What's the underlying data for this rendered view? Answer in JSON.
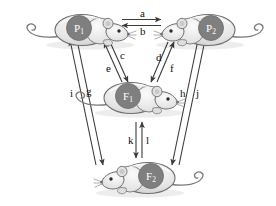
{
  "figure": {
    "background_color": "#ffffff",
    "line_color": "#3b3b3b",
    "badge_fill": "#7f7f7f",
    "badge_text_color": "#ffffff",
    "mouse_body_color": "#e9e9e9",
    "mouse_outline_color": "#6e6e6e"
  },
  "organisms": [
    {
      "id": "P1",
      "label": "P",
      "subscript": "1",
      "name": "parent-one-mouse",
      "facing": "right",
      "x": 88,
      "y": 30
    },
    {
      "id": "P2",
      "label": "P",
      "subscript": "2",
      "name": "parent-two-mouse",
      "facing": "left",
      "x": 202,
      "y": 30
    },
    {
      "id": "F1",
      "label": "F",
      "subscript": "1",
      "name": "f1-generation-mouse",
      "facing": "right",
      "x": 137,
      "y": 98
    },
    {
      "id": "F2",
      "label": "F",
      "subscript": "2",
      "name": "f2-generation-mouse",
      "facing": "left",
      "x": 142,
      "y": 178
    }
  ],
  "arrows": [
    {
      "id": "a",
      "label": "a",
      "from": "P1",
      "to": "P2",
      "label_x": 140,
      "label_y": 8,
      "direction": "right"
    },
    {
      "id": "b",
      "label": "b",
      "from": "P2",
      "to": "P1",
      "label_x": 140,
      "label_y": 26,
      "direction": "left"
    },
    {
      "id": "c",
      "label": "c",
      "from": "P1",
      "to": "F1",
      "label_x": 120,
      "label_y": 50,
      "direction": "down-right"
    },
    {
      "id": "e",
      "label": "e",
      "from": "F1",
      "to": "P1",
      "label_x": 106,
      "label_y": 63,
      "direction": "up-left"
    },
    {
      "id": "d",
      "label": "d",
      "from": "F1",
      "to": "P2",
      "label_x": 156,
      "label_y": 52,
      "direction": "up-right"
    },
    {
      "id": "f",
      "label": "f",
      "from": "P2",
      "to": "F1",
      "label_x": 170,
      "label_y": 63,
      "direction": "down-left"
    },
    {
      "id": "i",
      "label": "i",
      "from": "F2",
      "to": "P1",
      "label_x": 70,
      "label_y": 88,
      "direction": "up"
    },
    {
      "id": "g",
      "label": "g",
      "from": "P1",
      "to": "F2",
      "label_x": 86,
      "label_y": 86,
      "direction": "down"
    },
    {
      "id": "h",
      "label": "h",
      "from": "P2",
      "to": "F2",
      "label_x": 180,
      "label_y": 88,
      "direction": "down"
    },
    {
      "id": "j",
      "label": "j",
      "from": "F2",
      "to": "P2",
      "label_x": 196,
      "label_y": 88,
      "direction": "up"
    },
    {
      "id": "k",
      "label": "k",
      "from": "F1",
      "to": "F2",
      "label_x": 128,
      "label_y": 135,
      "direction": "down"
    },
    {
      "id": "l",
      "label": "l",
      "from": "F2",
      "to": "F1",
      "label_x": 146,
      "label_y": 135,
      "direction": "up"
    }
  ]
}
